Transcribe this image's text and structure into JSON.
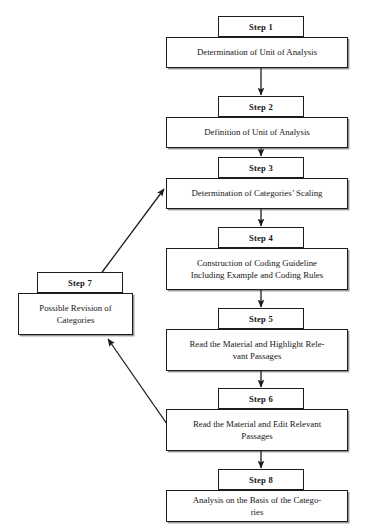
{
  "diagram": {
    "type": "flowchart",
    "background_color": "#ffffff",
    "line_color": "#1d1d1d",
    "nodes": [
      {
        "id": "step1",
        "step_label": "Step 1",
        "text": "Determination of Unit of Analysis",
        "tab": {
          "x": 218,
          "y": 16,
          "w": 86,
          "h": 21
        },
        "box": {
          "x": 166,
          "y": 37,
          "w": 182,
          "h": 31
        }
      },
      {
        "id": "step2",
        "step_label": "Step 2",
        "text": "Definition of Unit of Analysis",
        "tab": {
          "x": 218,
          "y": 96,
          "w": 86,
          "h": 21
        },
        "box": {
          "x": 166,
          "y": 117,
          "w": 182,
          "h": 31
        }
      },
      {
        "id": "step3",
        "step_label": "Step 3",
        "text": "Determination of Categories’ Scaling",
        "tab": {
          "x": 218,
          "y": 157,
          "w": 86,
          "h": 21
        },
        "box": {
          "x": 166,
          "y": 178,
          "w": 182,
          "h": 31
        }
      },
      {
        "id": "step4",
        "step_label": "Step 4",
        "text": "Construction of Coding Guideline\nIncluding Example and Coding Rules",
        "tab": {
          "x": 218,
          "y": 227,
          "w": 86,
          "h": 21
        },
        "box": {
          "x": 166,
          "y": 248,
          "w": 182,
          "h": 42
        }
      },
      {
        "id": "step5",
        "step_label": "Step 5",
        "text": "Read the Material and Highlight Rele-\nvant Passages",
        "tab": {
          "x": 218,
          "y": 308,
          "w": 86,
          "h": 21
        },
        "box": {
          "x": 166,
          "y": 329,
          "w": 182,
          "h": 42
        }
      },
      {
        "id": "step6",
        "step_label": "Step 6",
        "text": "Read the Material and Edit Relevant\nPassages",
        "tab": {
          "x": 218,
          "y": 388,
          "w": 86,
          "h": 21
        },
        "box": {
          "x": 166,
          "y": 409,
          "w": 182,
          "h": 42
        }
      },
      {
        "id": "step8",
        "step_label": "Step 8",
        "text": "Analysis on the Basis of the Catego-\nries",
        "tab": {
          "x": 218,
          "y": 469,
          "w": 86,
          "h": 21
        },
        "box": {
          "x": 166,
          "y": 490,
          "w": 182,
          "h": 32
        }
      },
      {
        "id": "step7",
        "step_label": "Step 7",
        "text": "Possible Revision of\nCategories",
        "tab": {
          "x": 37,
          "y": 272,
          "w": 86,
          "h": 21
        },
        "box": {
          "x": 18,
          "y": 293,
          "w": 115,
          "h": 42
        }
      }
    ],
    "edges": [
      {
        "id": "e1",
        "from": "step1",
        "to": "step2",
        "kind": "vertical-arrow"
      },
      {
        "id": "e2",
        "from": "step2",
        "to": "step3",
        "kind": "vertical-arrow"
      },
      {
        "id": "e3",
        "from": "step3",
        "to": "step4",
        "kind": "vertical-arrow"
      },
      {
        "id": "e4",
        "from": "step4",
        "to": "step5",
        "kind": "vertical-arrow"
      },
      {
        "id": "e5",
        "from": "step5",
        "to": "step6",
        "kind": "vertical-arrow"
      },
      {
        "id": "e6",
        "from": "step6",
        "to": "step8",
        "kind": "vertical-arrow"
      },
      {
        "id": "e7",
        "from": "step7",
        "to": "step3",
        "kind": "diagonal-arrow"
      },
      {
        "id": "e8",
        "from": "step6",
        "to": "step7",
        "kind": "diagonal-arrow"
      }
    ]
  }
}
